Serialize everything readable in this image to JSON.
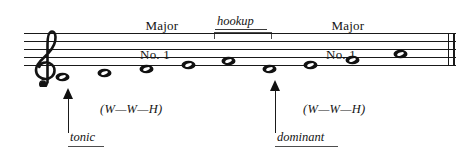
{
  "figure": {
    "type": "music-notation-staff",
    "clef": "treble-clef",
    "title_left": {
      "line1": "Major",
      "line2": "No. 1"
    },
    "title_right": {
      "line1": "Major",
      "line2": "No. 1"
    },
    "hookup": {
      "label": "hookup"
    },
    "annotations": {
      "tonic": "tonic",
      "dominant": "dominant",
      "interval_left": "(W—W—H)",
      "interval_right": "(W—W—H)"
    },
    "staff": {
      "line_count": 5,
      "final_barline": "double"
    },
    "notes": [
      {
        "index": 1,
        "x": 62,
        "step": 0,
        "ledger": false
      },
      {
        "index": 2,
        "x": 104,
        "step": 1,
        "ledger": false
      },
      {
        "index": 3,
        "x": 146,
        "step": 2,
        "ledger": false
      },
      {
        "index": 4,
        "x": 188,
        "step": 3,
        "ledger": false
      },
      {
        "index": 5,
        "x": 228,
        "step": 4,
        "ledger": false
      },
      {
        "index": 6,
        "x": 269,
        "step": 5,
        "ledger": false
      },
      {
        "index": 7,
        "x": 310,
        "step": 6,
        "ledger": false
      },
      {
        "index": 8,
        "x": 352,
        "step": 7,
        "ledger": false
      },
      {
        "index": 9,
        "x": 400,
        "step": 8,
        "ledger": false
      }
    ],
    "colors": {
      "ink": "#191919",
      "rule": "#4d4d4d",
      "background": "#ffffff"
    }
  }
}
